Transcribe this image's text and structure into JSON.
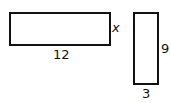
{
  "diagram": {
    "shapes": [
      {
        "id": "rect-a",
        "type": "rectangle",
        "orientation": "horizontal",
        "width_label": "12",
        "height_label": "x"
      },
      {
        "id": "rect-b",
        "type": "rectangle",
        "orientation": "vertical",
        "width_label": "3",
        "height_label": "9"
      }
    ],
    "labels": {
      "rect_a_width": "12",
      "rect_a_height": "x",
      "rect_b_width": "3",
      "rect_b_height": "9"
    }
  }
}
